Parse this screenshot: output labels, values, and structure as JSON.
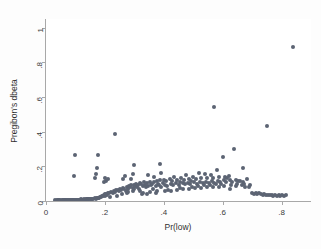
{
  "chart_data": {
    "type": "scatter",
    "title": "",
    "xlabel": "Pr(low)",
    "ylabel": "Pregibon's dbeta",
    "xlim": [
      0,
      0.9
    ],
    "ylim": [
      0,
      1.05
    ],
    "xticks": [
      0,
      0.2,
      0.4,
      0.6,
      0.8
    ],
    "xticklabels": [
      "0",
      ".2",
      ".4",
      ".6",
      ".8"
    ],
    "yticks": [
      0,
      0.2,
      0.4,
      0.6,
      0.8,
      1
    ],
    "yticklabels": [
      "0",
      ".2",
      ".4",
      ".6",
      ".8",
      "1"
    ],
    "grid": false,
    "legend": null,
    "marker": {
      "shape": "circle",
      "color": "#5c6473",
      "size": 4
    },
    "series": [
      {
        "name": "observations",
        "points": [
          [
            0.03,
            0.004
          ],
          [
            0.036,
            0.004
          ],
          [
            0.041,
            0.005
          ],
          [
            0.045,
            0.004
          ],
          [
            0.049,
            0.005
          ],
          [
            0.053,
            0.004
          ],
          [
            0.057,
            0.005
          ],
          [
            0.06,
            0.004
          ],
          [
            0.063,
            0.006
          ],
          [
            0.066,
            0.005
          ],
          [
            0.069,
            0.004
          ],
          [
            0.072,
            0.006
          ],
          [
            0.075,
            0.005
          ],
          [
            0.078,
            0.006
          ],
          [
            0.081,
            0.005
          ],
          [
            0.084,
            0.006
          ],
          [
            0.087,
            0.005
          ],
          [
            0.09,
            0.007
          ],
          [
            0.093,
            0.006
          ],
          [
            0.096,
            0.006
          ],
          [
            0.099,
            0.007
          ],
          [
            0.102,
            0.006
          ],
          [
            0.105,
            0.008
          ],
          [
            0.108,
            0.007
          ],
          [
            0.111,
            0.007
          ],
          [
            0.114,
            0.008
          ],
          [
            0.117,
            0.007
          ],
          [
            0.12,
            0.009
          ],
          [
            0.123,
            0.008
          ],
          [
            0.126,
            0.008
          ],
          [
            0.129,
            0.009
          ],
          [
            0.132,
            0.008
          ],
          [
            0.135,
            0.01
          ],
          [
            0.138,
            0.009
          ],
          [
            0.141,
            0.009
          ],
          [
            0.144,
            0.01
          ],
          [
            0.147,
            0.01
          ],
          [
            0.15,
            0.01
          ],
          [
            0.153,
            0.011
          ],
          [
            0.156,
            0.01
          ],
          [
            0.096,
            0.145
          ],
          [
            0.098,
            0.268
          ],
          [
            0.16,
            0.013
          ],
          [
            0.165,
            0.015
          ],
          [
            0.17,
            0.014
          ],
          [
            0.172,
            0.018
          ],
          [
            0.175,
            0.016
          ],
          [
            0.178,
            0.02
          ],
          [
            0.18,
            0.017
          ],
          [
            0.183,
            0.022
          ],
          [
            0.166,
            0.133
          ],
          [
            0.169,
            0.155
          ],
          [
            0.172,
            0.19
          ],
          [
            0.175,
            0.265
          ],
          [
            0.186,
            0.024
          ],
          [
            0.19,
            0.03
          ],
          [
            0.193,
            0.027
          ],
          [
            0.196,
            0.035
          ],
          [
            0.199,
            0.031
          ],
          [
            0.202,
            0.04
          ],
          [
            0.196,
            0.108
          ],
          [
            0.199,
            0.131
          ],
          [
            0.205,
            0.043
          ],
          [
            0.208,
            0.037
          ],
          [
            0.211,
            0.048
          ],
          [
            0.214,
            0.044
          ],
          [
            0.205,
            0.118
          ],
          [
            0.211,
            0.127
          ],
          [
            0.218,
            0.025
          ],
          [
            0.222,
            0.052
          ],
          [
            0.226,
            0.046
          ],
          [
            0.23,
            0.058
          ],
          [
            0.234,
            0.05
          ],
          [
            0.238,
            0.062
          ],
          [
            0.24,
            0.031
          ],
          [
            0.244,
            0.066
          ],
          [
            0.236,
            0.386
          ],
          [
            0.248,
            0.055
          ],
          [
            0.252,
            0.07
          ],
          [
            0.256,
            0.064
          ],
          [
            0.258,
            0.038
          ],
          [
            0.262,
            0.074
          ],
          [
            0.266,
            0.068
          ],
          [
            0.262,
            0.128
          ],
          [
            0.268,
            0.142
          ],
          [
            0.27,
            0.06
          ],
          [
            0.274,
            0.078
          ],
          [
            0.278,
            0.072
          ],
          [
            0.282,
            0.085
          ],
          [
            0.274,
            0.045
          ],
          [
            0.28,
            0.052
          ],
          [
            0.286,
            0.08
          ],
          [
            0.29,
            0.09
          ],
          [
            0.294,
            0.076
          ],
          [
            0.296,
            0.056
          ],
          [
            0.298,
            0.095
          ],
          [
            0.3,
            0.068
          ],
          [
            0.302,
            0.088
          ],
          [
            0.305,
            0.1
          ],
          [
            0.29,
            0.126
          ],
          [
            0.296,
            0.156
          ],
          [
            0.3,
            0.205
          ],
          [
            0.308,
            0.082
          ],
          [
            0.312,
            0.092
          ],
          [
            0.316,
            0.07
          ],
          [
            0.318,
            0.102
          ],
          [
            0.32,
            0.06
          ],
          [
            0.324,
            0.096
          ],
          [
            0.328,
            0.086
          ],
          [
            0.332,
            0.108
          ],
          [
            0.326,
            0.038
          ],
          [
            0.33,
            0.046
          ],
          [
            0.336,
            0.09
          ],
          [
            0.34,
            0.078
          ],
          [
            0.344,
            0.104
          ],
          [
            0.348,
            0.084
          ],
          [
            0.352,
            0.112
          ],
          [
            0.356,
            0.094
          ],
          [
            0.344,
            0.043
          ],
          [
            0.352,
            0.05
          ],
          [
            0.346,
            0.15
          ],
          [
            0.36,
            0.098
          ],
          [
            0.364,
            0.072
          ],
          [
            0.368,
            0.11
          ],
          [
            0.372,
            0.088
          ],
          [
            0.376,
            0.118
          ],
          [
            0.38,
            0.1
          ],
          [
            0.372,
            0.047
          ],
          [
            0.378,
            0.056
          ],
          [
            0.368,
            0.136
          ],
          [
            0.384,
            0.092
          ],
          [
            0.388,
            0.12
          ],
          [
            0.392,
            0.08
          ],
          [
            0.396,
            0.106
          ],
          [
            0.386,
            0.216
          ],
          [
            0.392,
            0.16
          ],
          [
            0.4,
            0.124
          ],
          [
            0.404,
            0.094
          ],
          [
            0.408,
            0.114
          ],
          [
            0.412,
            0.086
          ],
          [
            0.404,
            0.057
          ],
          [
            0.414,
            0.064
          ],
          [
            0.42,
            0.128
          ],
          [
            0.424,
            0.1
          ],
          [
            0.428,
            0.118
          ],
          [
            0.432,
            0.09
          ],
          [
            0.426,
            0.06
          ],
          [
            0.436,
            0.14
          ],
          [
            0.442,
            0.102
          ],
          [
            0.446,
            0.122
          ],
          [
            0.45,
            0.094
          ],
          [
            0.454,
            0.112
          ],
          [
            0.446,
            0.066
          ],
          [
            0.456,
            0.074
          ],
          [
            0.46,
            0.134
          ],
          [
            0.464,
            0.104
          ],
          [
            0.468,
            0.124
          ],
          [
            0.472,
            0.096
          ],
          [
            0.466,
            0.07
          ],
          [
            0.476,
            0.152
          ],
          [
            0.482,
            0.106
          ],
          [
            0.486,
            0.126
          ],
          [
            0.49,
            0.098
          ],
          [
            0.494,
            0.116
          ],
          [
            0.486,
            0.072
          ],
          [
            0.496,
            0.08
          ],
          [
            0.5,
            0.138
          ],
          [
            0.504,
            0.108
          ],
          [
            0.508,
            0.128
          ],
          [
            0.512,
            0.1
          ],
          [
            0.506,
            0.074
          ],
          [
            0.516,
            0.086
          ],
          [
            0.52,
            0.162
          ],
          [
            0.524,
            0.11
          ],
          [
            0.528,
            0.13
          ],
          [
            0.532,
            0.102
          ],
          [
            0.526,
            0.076
          ],
          [
            0.536,
            0.09
          ],
          [
            0.54,
            0.156
          ],
          [
            0.544,
            0.112
          ],
          [
            0.548,
            0.132
          ],
          [
            0.552,
            0.104
          ],
          [
            0.546,
            0.078
          ],
          [
            0.556,
            0.094
          ],
          [
            0.56,
            0.15
          ],
          [
            0.564,
            0.114
          ],
          [
            0.568,
            0.134
          ],
          [
            0.572,
            0.106
          ],
          [
            0.566,
            0.08
          ],
          [
            0.576,
            0.096
          ],
          [
            0.57,
            0.54
          ],
          [
            0.58,
            0.176
          ],
          [
            0.584,
            0.118
          ],
          [
            0.588,
            0.136
          ],
          [
            0.592,
            0.108
          ],
          [
            0.586,
            0.082
          ],
          [
            0.596,
            0.1
          ],
          [
            0.6,
            0.252
          ],
          [
            0.604,
            0.12
          ],
          [
            0.608,
            0.138
          ],
          [
            0.612,
            0.11
          ],
          [
            0.606,
            0.084
          ],
          [
            0.616,
            0.13
          ],
          [
            0.62,
            0.142
          ],
          [
            0.624,
            0.122
          ],
          [
            0.628,
            0.092
          ],
          [
            0.632,
            0.112
          ],
          [
            0.626,
            0.07
          ],
          [
            0.64,
            0.3
          ],
          [
            0.644,
            0.124
          ],
          [
            0.648,
            0.096
          ],
          [
            0.652,
            0.114
          ],
          [
            0.646,
            0.086
          ],
          [
            0.66,
            0.116
          ],
          [
            0.664,
            0.09
          ],
          [
            0.668,
            0.108
          ],
          [
            0.672,
            0.098
          ],
          [
            0.668,
            0.188
          ],
          [
            0.676,
            0.078
          ],
          [
            0.684,
            0.128
          ],
          [
            0.688,
            0.082
          ],
          [
            0.692,
            0.094
          ],
          [
            0.7,
            0.044
          ],
          [
            0.706,
            0.04
          ],
          [
            0.712,
            0.046
          ],
          [
            0.718,
            0.038
          ],
          [
            0.724,
            0.044
          ],
          [
            0.73,
            0.04
          ],
          [
            0.736,
            0.036
          ],
          [
            0.742,
            0.038
          ],
          [
            0.748,
            0.034
          ],
          [
            0.754,
            0.036
          ],
          [
            0.76,
            0.032
          ],
          [
            0.766,
            0.034
          ],
          [
            0.772,
            0.03
          ],
          [
            0.778,
            0.034
          ],
          [
            0.784,
            0.03
          ],
          [
            0.79,
            0.032
          ],
          [
            0.796,
            0.03
          ],
          [
            0.802,
            0.032
          ],
          [
            0.808,
            0.03
          ],
          [
            0.814,
            0.032
          ],
          [
            0.752,
            0.43
          ],
          [
            0.84,
            0.89
          ]
        ]
      }
    ]
  }
}
